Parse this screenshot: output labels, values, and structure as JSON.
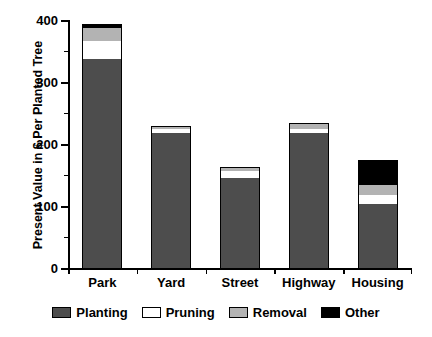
{
  "chart_data": {
    "type": "bar",
    "stacked": true,
    "title": "",
    "xlabel": "",
    "ylabel": "Present Value in $ Per Planted Tree",
    "categories": [
      "Park",
      "Yard",
      "Street",
      "Highway",
      "Housing"
    ],
    "series": [
      {
        "name": "Planting",
        "color": "#4d4d4d",
        "values": [
          337,
          218,
          145,
          218,
          103
        ]
      },
      {
        "name": "Pruning",
        "color": "#ffffff",
        "values": [
          29,
          6,
          11,
          6,
          15
        ]
      },
      {
        "name": "Removal",
        "color": "#b3b3b3",
        "values": [
          21,
          5,
          7,
          8,
          16
        ]
      },
      {
        "name": "Other",
        "color": "#000000",
        "values": [
          7,
          0,
          0,
          2,
          40
        ]
      }
    ],
    "totals": [
      394,
      229,
      163,
      234,
      174
    ],
    "ylim": [
      0,
      400
    ],
    "ytick_major": [
      0,
      100,
      200,
      300,
      400
    ],
    "ytick_minor": [
      50,
      150,
      250,
      350
    ],
    "ytick_labels": [
      "0",
      "100",
      "200",
      "300",
      "400"
    ],
    "grid": false,
    "legend_position": "bottom"
  },
  "legend": {
    "items": [
      {
        "label": "Planting",
        "swatch": "planting"
      },
      {
        "label": "Pruning",
        "swatch": "pruning"
      },
      {
        "label": "Removal",
        "swatch": "removal"
      },
      {
        "label": "Other",
        "swatch": "other"
      }
    ]
  }
}
